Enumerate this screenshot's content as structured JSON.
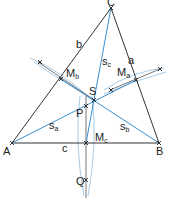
{
  "diagram": {
    "points": {
      "A": {
        "label": "A",
        "x": 12,
        "y": 143
      },
      "B": {
        "label": "B",
        "x": 159,
        "y": 143
      },
      "C": {
        "label": "C",
        "x": 111,
        "y": 8
      },
      "Ma": {
        "label": "M",
        "sub": "a",
        "x": 136,
        "y": 80
      },
      "Mb": {
        "label": "M",
        "sub": "b",
        "x": 61,
        "y": 79
      },
      "Mc": {
        "label": "M",
        "sub": "c",
        "x": 86,
        "y": 143
      },
      "S": {
        "label": "S",
        "x": 94,
        "y": 100
      },
      "P": {
        "label": "P",
        "x": 86,
        "y": 106
      },
      "Q": {
        "label": "Q",
        "x": 86,
        "y": 180
      }
    },
    "sides": {
      "a": "a",
      "b": "b",
      "c": "c"
    },
    "medians": {
      "sa": {
        "label": "s",
        "sub": "a"
      },
      "sb": {
        "label": "s",
        "sub": "b"
      },
      "sc": {
        "label": "s",
        "sub": "c"
      }
    },
    "colors": {
      "triangle": "#333333",
      "median": "#3a8fd0",
      "construction": "#8fbde0",
      "perpendicular": "#555555"
    }
  }
}
